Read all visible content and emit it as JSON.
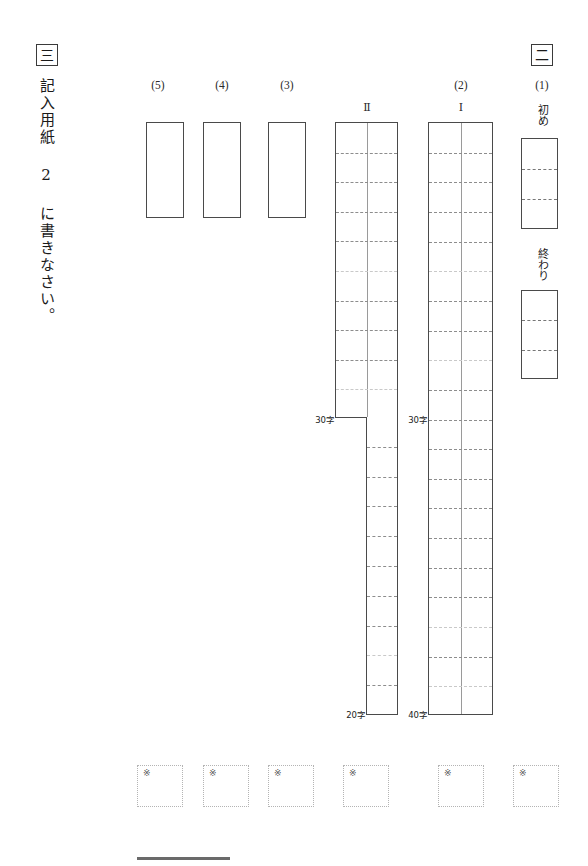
{
  "sheet": {
    "title": "国語 解答用紙",
    "background_color": "#ffffff",
    "ink_color": "#1a1a1a"
  },
  "section_three": {
    "badge": "三",
    "instruction": "記入用紙 2 に書きなさい。"
  },
  "section_two": {
    "badge": "二",
    "items": [
      {
        "label": "(1)",
        "type": "start-end-pair",
        "sub_labels": [
          "初め",
          "終わり"
        ],
        "cells_per_box": 3
      },
      {
        "label": "(2)",
        "type": "manuscript-grids",
        "grids": [
          {
            "roman": "Ⅰ",
            "columns": 2,
            "mid_marker": "30字",
            "end_marker": "40字",
            "rows_upper": 10,
            "rows_lower": 10,
            "narrows_below_mid": false
          },
          {
            "roman": "Ⅱ",
            "columns": 2,
            "mid_marker": "30字",
            "end_marker": "20字",
            "rows_upper": 10,
            "rows_lower": 10,
            "narrows_below_mid": true
          }
        ]
      },
      {
        "label": "(3)",
        "type": "plain-box"
      },
      {
        "label": "(4)",
        "type": "plain-box"
      },
      {
        "label": "(5)",
        "type": "plain-box"
      }
    ]
  },
  "score_boxes": {
    "mark": "※",
    "count": 6,
    "boxes": [
      {
        "mark": "※"
      },
      {
        "mark": "※"
      },
      {
        "mark": "※"
      },
      {
        "mark": "※"
      },
      {
        "mark": "※"
      },
      {
        "mark": "※"
      }
    ]
  },
  "markers": {
    "mid_left": "30字",
    "mid_right": "30字",
    "end_left": "20字",
    "end_right": "40字"
  },
  "labels": {
    "five": "(5)",
    "four": "(4)",
    "three": "(3)",
    "two": "(2)",
    "one": "(1)",
    "roman_two": "Ⅱ",
    "roman_one": "Ⅰ",
    "hajime": "初め",
    "owari": "終わり"
  }
}
